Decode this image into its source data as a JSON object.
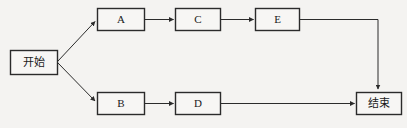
{
  "diagram": {
    "type": "flowchart",
    "title": "",
    "background_color": "#f4f3f1",
    "stroke_color": "#2b2b2b",
    "box_fill_color": "#f7f6f4",
    "nodes": [
      {
        "id": "start",
        "label": "开始",
        "script": "cjk",
        "x": 10,
        "y": 50,
        "w": 47,
        "h": 24
      },
      {
        "id": "a",
        "label": "A",
        "script": "latin",
        "x": 97,
        "y": 8,
        "w": 47,
        "h": 23
      },
      {
        "id": "c",
        "label": "C",
        "script": "latin",
        "x": 175,
        "y": 8,
        "w": 45,
        "h": 23
      },
      {
        "id": "e",
        "label": "E",
        "script": "latin",
        "x": 255,
        "y": 8,
        "w": 44,
        "h": 23
      },
      {
        "id": "b",
        "label": "B",
        "script": "latin",
        "x": 97,
        "y": 92,
        "w": 47,
        "h": 23
      },
      {
        "id": "d",
        "label": "D",
        "script": "latin",
        "x": 175,
        "y": 92,
        "w": 45,
        "h": 23
      },
      {
        "id": "end",
        "label": "结束",
        "script": "cjk",
        "x": 356,
        "y": 92,
        "w": 45,
        "h": 23
      }
    ],
    "edges": [
      {
        "id": "start-to-a",
        "from": "start",
        "to": "a",
        "style": "diagonal",
        "arrow": true
      },
      {
        "id": "start-to-b",
        "from": "start",
        "to": "b",
        "style": "diagonal",
        "arrow": true
      },
      {
        "id": "a-to-c",
        "from": "a",
        "to": "c",
        "style": "horizontal",
        "arrow": true
      },
      {
        "id": "c-to-e",
        "from": "c",
        "to": "e",
        "style": "horizontal",
        "arrow": true
      },
      {
        "id": "e-to-end",
        "from": "e",
        "to": "end",
        "style": "elbow-right-down",
        "arrow": true
      },
      {
        "id": "b-to-d",
        "from": "b",
        "to": "d",
        "style": "horizontal",
        "arrow": true
      },
      {
        "id": "d-to-end",
        "from": "d",
        "to": "end",
        "style": "horizontal",
        "arrow": true
      }
    ]
  }
}
